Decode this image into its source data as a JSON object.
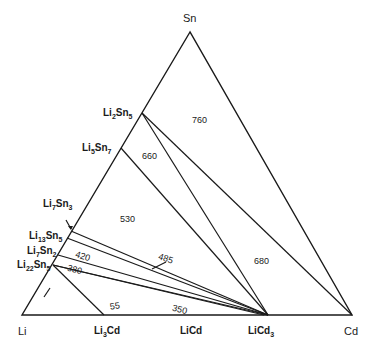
{
  "diagram": {
    "type": "ternary-phase-diagram",
    "vertices": {
      "top": {
        "label": "Sn",
        "x": 190,
        "y": 32
      },
      "left": {
        "label": "Li",
        "x": 22,
        "y": 315
      },
      "right": {
        "label": "Cd",
        "x": 352,
        "y": 315
      }
    },
    "edge_compounds": {
      "li_sn": [
        {
          "id": "li2sn5",
          "base": "Li",
          "sub1": "2",
          "mid": "Sn",
          "sub2": "5",
          "x": 142,
          "y": 113
        },
        {
          "id": "li5sn7",
          "base": "Li",
          "sub1": "5",
          "mid": "Sn",
          "sub2": "7",
          "x": 121,
          "y": 148
        },
        {
          "id": "li7sn3",
          "base": "Li",
          "sub1": "7",
          "mid": "Sn",
          "sub2": "3",
          "x": 72,
          "y": 228
        },
        {
          "id": "li13sn5",
          "base": "Li",
          "sub1": "13",
          "mid": "Sn",
          "sub2": "5",
          "x": 70,
          "y": 232
        },
        {
          "id": "li7sn2",
          "base": "Li",
          "sub1": "7",
          "mid": "Sn",
          "sub2": "2",
          "x": 60,
          "y": 252
        },
        {
          "id": "li22sn5",
          "base": "Li",
          "sub1": "22",
          "mid": "Sn",
          "sub2": "5",
          "x": 53,
          "y": 265
        }
      ],
      "li_cd": [
        {
          "id": "li3cd",
          "base": "Li",
          "sub1": "3",
          "mid": "Cd",
          "sub2": "",
          "x": 104,
          "y": 315
        },
        {
          "id": "licd",
          "base": "LiCd",
          "sub1": "",
          "mid": "",
          "sub2": "",
          "x": 198,
          "y": 315
        },
        {
          "id": "licd3",
          "base": "LiCd",
          "sub1": "",
          "mid": "",
          "sub2": "3",
          "x": 268,
          "y": 315
        }
      ]
    },
    "tie_lines": [
      {
        "from": "li2sn5",
        "to": "cd"
      },
      {
        "from": "li2sn5",
        "to": "licd3"
      },
      {
        "from": "li5sn7",
        "to": "licd3"
      },
      {
        "from": "li13sn5",
        "to": "licd3"
      },
      {
        "from": "li13sn5b",
        "to": "licd3"
      },
      {
        "from": "li7sn2",
        "to": "licd3"
      },
      {
        "from": "li22sn5",
        "to": "licd3"
      },
      {
        "from": "li22sn5b",
        "to": "licd3"
      },
      {
        "from": "li22sn5",
        "to": "li3cd"
      }
    ],
    "region_labels": [
      {
        "text": "760",
        "x": 199,
        "y": 120
      },
      {
        "text": "660",
        "x": 148,
        "y": 158
      },
      {
        "text": "530",
        "x": 127,
        "y": 220
      },
      {
        "text": "485",
        "x": 164,
        "y": 259
      },
      {
        "text": "420",
        "x": 82,
        "y": 257
      },
      {
        "text": "380",
        "x": 73,
        "y": 270
      },
      {
        "text": "680",
        "x": 261,
        "y": 262
      },
      {
        "text": "55",
        "x": 115,
        "y": 307
      },
      {
        "text": "350",
        "x": 178,
        "y": 310
      }
    ]
  }
}
